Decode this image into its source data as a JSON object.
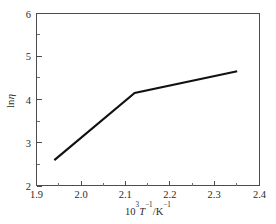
{
  "chart_data": {
    "type": "line",
    "title": "",
    "subtitle": "",
    "xlabel": "10³T⁻¹/K⁻¹",
    "ylabel": "lnη",
    "xlim": [
      1.9,
      2.4
    ],
    "ylim": [
      2,
      6
    ],
    "grid": false,
    "legend": false,
    "legend_position": "none",
    "x_major_ticks": [
      1.9,
      2.0,
      2.1,
      2.2,
      2.3,
      2.4
    ],
    "x_tick_labels": [
      "1.9",
      "2.0",
      "2.1",
      "2.2",
      "2.3",
      "2.4"
    ],
    "x_minor_ticks": [
      1.95,
      2.05,
      2.15,
      2.25,
      2.35
    ],
    "y_major_ticks": [
      2,
      3,
      4,
      5,
      6
    ],
    "y_tick_labels": [
      "2",
      "3",
      "4",
      "5",
      "6"
    ],
    "y_minor_ticks": [
      2.5,
      3.5,
      4.5,
      5.5
    ],
    "tick_direction": "in",
    "line_color": "#111111",
    "frame_color": "#4c4c4c",
    "background_color": "#ffffff",
    "series": [
      {
        "name": "lnη",
        "x": [
          1.94,
          2.12,
          2.35
        ],
        "values": [
          2.6,
          4.16,
          4.66
        ],
        "marker": "none",
        "color": "#111111"
      }
    ]
  },
  "axes": {
    "x_title_parts": {
      "base": "10",
      "base_exp": "3",
      "variable": "T",
      "variable_exp": "−1",
      "separator": "/",
      "unit": "K",
      "unit_exp": "−1"
    },
    "y_title_parts": {
      "prefix": "ln",
      "symbol": "η"
    }
  }
}
